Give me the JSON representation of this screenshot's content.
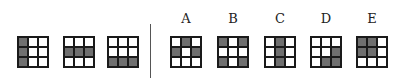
{
  "puzzle": {
    "question_grids": [
      {
        "id": "q1",
        "shaded": [
          0,
          3,
          6
        ],
        "x": 17
      },
      {
        "id": "q2",
        "shaded": [
          3,
          4,
          5
        ],
        "x": 63
      },
      {
        "id": "q3",
        "shaded": [
          6,
          7,
          8
        ],
        "x": 107
      }
    ],
    "options": [
      {
        "label": "A",
        "shaded": [
          1,
          3,
          5
        ],
        "x": 170
      },
      {
        "label": "B",
        "shaded": [
          0,
          2,
          6,
          8
        ],
        "x": 217
      },
      {
        "label": "C",
        "shaded": [
          1,
          4,
          7
        ],
        "x": 264
      },
      {
        "label": "D",
        "shaded": [
          5,
          7,
          8
        ],
        "x": 310
      },
      {
        "label": "E",
        "shaded": [
          0,
          1,
          3,
          4
        ],
        "x": 356
      }
    ],
    "colors": {
      "shaded": "#6f6f6f",
      "empty": "#ffffff",
      "border": "#1a1a1a"
    }
  }
}
